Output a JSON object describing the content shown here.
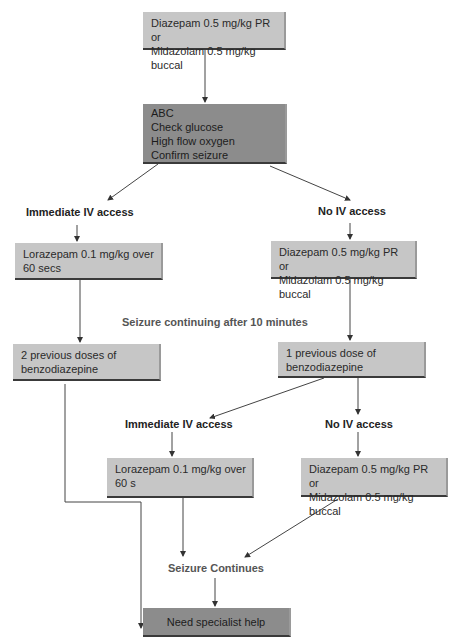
{
  "flowchart": {
    "start_box": {
      "line1": "Diazepam 0.5 mg/kg PR or",
      "line2": "Midazolam 0.5 mg/kg buccal"
    },
    "assessment_box": {
      "lines": [
        "ABC",
        "Check glucose",
        "High flow oxygen",
        "Confirm seizure"
      ]
    },
    "branch1": {
      "left_label": "Immediate IV access",
      "right_label": "No IV access",
      "left_box": {
        "line1": "Lorazepam 0.1 mg/kg over",
        "line2": "60 secs"
      },
      "right_box": {
        "line1": "Diazepam 0.5 mg/kg PR or",
        "line2": "Midazolam 0.5 mg/kg buccal"
      }
    },
    "continuation_label": "Seizure continuing after 10 minutes",
    "dose_boxes": {
      "left": {
        "line1": "2 previous doses of",
        "line2": "benzodiazepine"
      },
      "right": {
        "line1": "1 previous dose of",
        "line2": "benzodiazepine"
      }
    },
    "branch2": {
      "left_label": "Immediate IV access",
      "right_label": "No IV access",
      "left_box": {
        "line1": "Lorazepam 0.1 mg/kg over",
        "line2": "60 s"
      },
      "right_box": {
        "line1": "Diazepam 0.5 mg/kg PR or",
        "line2": "Midazolam 0.5 mg/kg buccal"
      }
    },
    "seizure_continues_label": "Seizure Continues",
    "final_box": {
      "text": "Need specialist help"
    },
    "colors": {
      "light_box": "#c6c6c6",
      "dark_box": "#8c8c8c",
      "line": "#333333"
    }
  }
}
